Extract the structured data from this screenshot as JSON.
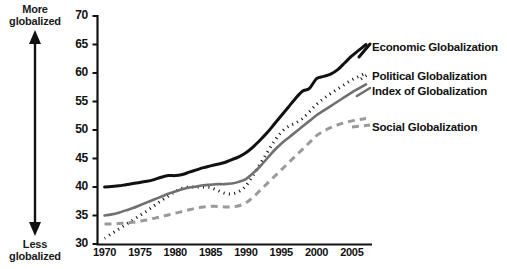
{
  "chart_data": {
    "type": "line",
    "title": "",
    "xlabel": "",
    "ylabel": "",
    "xlim": [
      1969,
      2007
    ],
    "ylim": [
      30,
      70
    ],
    "grid": false,
    "legend_position": "right",
    "y_ticks": [
      70,
      65,
      60,
      55,
      50,
      45,
      40,
      35,
      30
    ],
    "x_ticks": [
      1970,
      1975,
      1980,
      1985,
      1990,
      1995,
      2000,
      2005
    ],
    "axis_annotations": {
      "top": "More\nglobalized",
      "top_line1": "More",
      "top_line2": "globalized",
      "bottom_line1": "Less",
      "bottom_line2": "globalized"
    },
    "x": [
      1970,
      1971,
      1972,
      1973,
      1974,
      1975,
      1976,
      1977,
      1978,
      1979,
      1980,
      1981,
      1982,
      1983,
      1984,
      1985,
      1986,
      1987,
      1988,
      1989,
      1990,
      1991,
      1992,
      1993,
      1994,
      1995,
      1996,
      1997,
      1998,
      1999,
      2000,
      2001,
      2002,
      2003,
      2004,
      2005,
      2006,
      2007
    ],
    "series": [
      {
        "name": "Economic Globalization",
        "style": "solid",
        "color": "#111111",
        "width": 3.0,
        "values": [
          40.0,
          40.1,
          40.2,
          40.4,
          40.6,
          40.8,
          41.0,
          41.3,
          41.7,
          42.0,
          42.0,
          42.2,
          42.6,
          43.0,
          43.4,
          43.7,
          44.0,
          44.3,
          44.8,
          45.3,
          46.0,
          47.0,
          48.2,
          49.5,
          51.0,
          52.5,
          54.0,
          55.5,
          56.8,
          57.3,
          59.0,
          59.4,
          59.8,
          60.6,
          61.8,
          63.0,
          64.0,
          65.0
        ]
      },
      {
        "name": "Political Globalization",
        "style": "dotted",
        "color": "#111111",
        "width": 3.0,
        "values": [
          31.0,
          31.8,
          32.6,
          33.4,
          34.2,
          35.0,
          35.8,
          36.7,
          37.6,
          38.4,
          39.2,
          39.8,
          40.0,
          40.0,
          40.0,
          39.9,
          39.4,
          38.9,
          38.8,
          39.2,
          40.2,
          42.0,
          44.0,
          46.0,
          48.0,
          49.6,
          50.6,
          51.2,
          52.0,
          53.2,
          54.5,
          55.5,
          56.4,
          57.2,
          58.0,
          58.8,
          59.4,
          60.0
        ]
      },
      {
        "name": "Index of Globalization",
        "style": "solid",
        "color": "#707070",
        "width": 2.6,
        "values": [
          35.0,
          35.2,
          35.5,
          35.9,
          36.3,
          36.8,
          37.3,
          37.8,
          38.3,
          38.8,
          39.2,
          39.6,
          39.9,
          40.1,
          40.3,
          40.4,
          40.5,
          40.5,
          40.6,
          40.9,
          41.4,
          42.4,
          43.6,
          45.0,
          46.4,
          47.6,
          48.6,
          49.6,
          50.6,
          51.6,
          52.6,
          53.4,
          54.2,
          55.0,
          55.8,
          56.6,
          57.3,
          58.0
        ]
      },
      {
        "name": "Social Globalization",
        "style": "dashed",
        "color": "#9a9a9a",
        "width": 3.0,
        "values": [
          33.5,
          33.5,
          33.6,
          33.7,
          33.8,
          34.0,
          34.2,
          34.5,
          34.8,
          35.1,
          35.4,
          35.7,
          36.0,
          36.3,
          36.5,
          36.6,
          36.6,
          36.5,
          36.5,
          36.7,
          37.2,
          38.2,
          39.4,
          40.6,
          41.8,
          43.0,
          44.2,
          45.4,
          46.6,
          47.8,
          49.0,
          49.8,
          50.4,
          50.9,
          51.3,
          51.6,
          51.8,
          52.0
        ]
      }
    ]
  },
  "legend": {
    "items": [
      {
        "label": "Economic Globalization",
        "style": "solid",
        "color": "#111111"
      },
      {
        "label": "Political Globalization",
        "style": "dotted",
        "color": "#111111"
      },
      {
        "label": "Index of Globalization",
        "style": "solid",
        "color": "#707070"
      },
      {
        "label": "Social Globalization",
        "style": "dashed",
        "color": "#9a9a9a"
      }
    ]
  }
}
